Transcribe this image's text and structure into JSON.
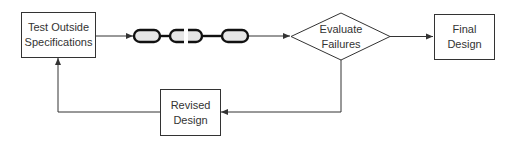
{
  "diagram": {
    "type": "flowchart",
    "nodes": [
      {
        "id": "test",
        "shape": "rectangle",
        "label_line1": "Test Outside",
        "label_line2": "Specifications"
      },
      {
        "id": "chain",
        "shape": "chain-icon",
        "label": "broken chain (failure)"
      },
      {
        "id": "evaluate",
        "shape": "diamond",
        "label_line1": "Evaluate",
        "label_line2": "Failures"
      },
      {
        "id": "final",
        "shape": "rectangle",
        "label_line1": "Final",
        "label_line2": "Design"
      },
      {
        "id": "revised",
        "shape": "rectangle",
        "label_line1": "Revised",
        "label_line2": "Design"
      }
    ],
    "edges": [
      {
        "from": "test",
        "to": "chain"
      },
      {
        "from": "chain",
        "to": "evaluate"
      },
      {
        "from": "evaluate",
        "to": "final"
      },
      {
        "from": "evaluate",
        "to": "revised"
      },
      {
        "from": "revised",
        "to": "test"
      }
    ],
    "colors": {
      "stroke": "#333333",
      "text": "#333333",
      "link_fill": "#e6e6e6"
    }
  }
}
